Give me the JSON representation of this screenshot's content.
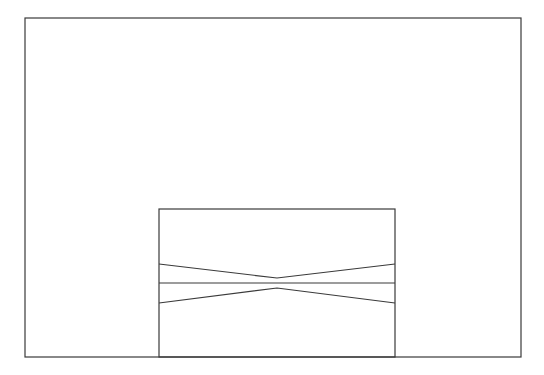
{
  "canvas": {
    "width": 544,
    "height": 375,
    "background": "#ffffff"
  },
  "stroke": {
    "color": "#3a3a3a",
    "width": 1.2
  },
  "outer_rect": {
    "x": 25,
    "y": 18,
    "w": 496,
    "h": 339
  },
  "inner_rect": {
    "x": 159,
    "y": 209,
    "w": 236,
    "h": 148
  },
  "lines": [
    {
      "name": "upper-v-line",
      "points": "159,264 277,278 395,264"
    },
    {
      "name": "middle-horizontal-line",
      "points": "159,283 395,283"
    },
    {
      "name": "lower-v-line",
      "points": "159,303 277,288 395,303"
    }
  ]
}
